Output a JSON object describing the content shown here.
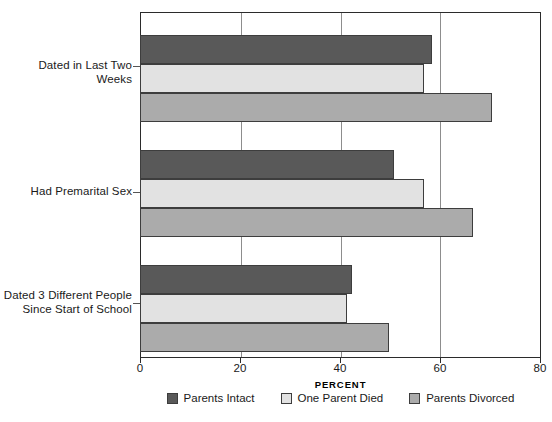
{
  "chart_data": {
    "type": "bar",
    "orientation": "horizontal",
    "title": "",
    "xlabel": "PERCENT",
    "ylabel": "",
    "xlim": [
      0,
      80
    ],
    "xticks": [
      0,
      20,
      40,
      60,
      80
    ],
    "xtick_labels": [
      "0",
      "20",
      "40",
      "60",
      "80"
    ],
    "grid": true,
    "grid_axis": "x",
    "legend_position": "bottom",
    "categories": [
      "Dated in Last Two Weeks",
      "Had Premarital Sex",
      "Dated 3 Different People\nSince Start of School"
    ],
    "series": [
      {
        "name": "Parents Intact",
        "color": "#595959",
        "values": [
          58.5,
          51.0,
          42.5
        ]
      },
      {
        "name": "One Parent Died",
        "color": "#e2e2e2",
        "values": [
          57.0,
          57.0,
          41.5
        ]
      },
      {
        "name": "Parents Divorced",
        "color": "#ababab",
        "values": [
          70.5,
          66.8,
          50.0
        ]
      }
    ]
  },
  "style": {
    "frame_color": "#2b2b2b",
    "grid_color": "#8d8d8d",
    "bar_edge_color": "#3d3d3d",
    "background": "#ffffff"
  }
}
